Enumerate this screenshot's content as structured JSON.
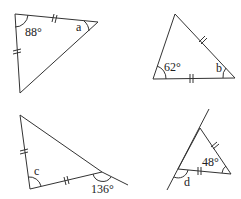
{
  "triangles": [
    {
      "id": "t1",
      "known_angle": "88°",
      "unknown_label": "a",
      "equal_sides": 2
    },
    {
      "id": "t2",
      "known_angle": "62°",
      "unknown_label": "b",
      "equal_sides": 2
    },
    {
      "id": "t3",
      "unknown_label": "c",
      "exterior_angle": "136°",
      "equal_sides": 2
    },
    {
      "id": "t4",
      "known_angle": "48°",
      "unknown_label": "d",
      "equal_sides": 2
    }
  ],
  "colors": {
    "stroke": "#333333",
    "background": "#ffffff"
  }
}
